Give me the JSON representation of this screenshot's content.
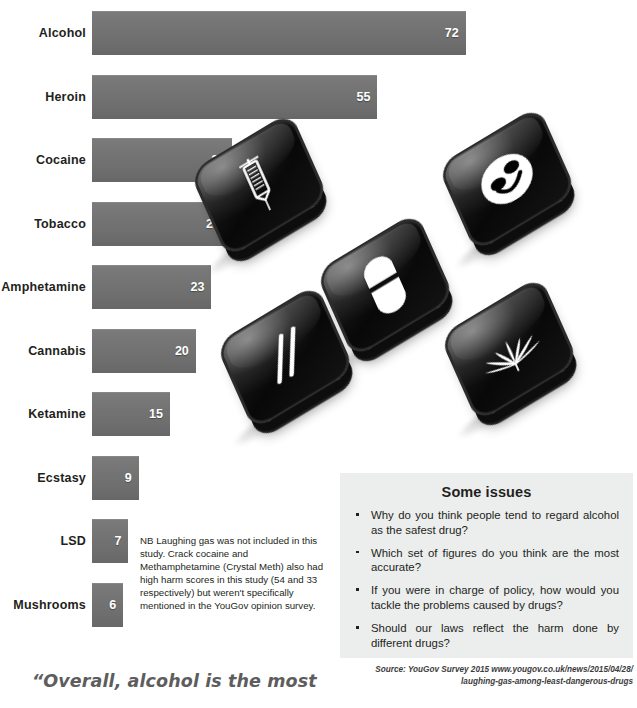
{
  "chart_data": {
    "type": "bar",
    "title": "",
    "xlabel": "",
    "ylabel": "",
    "orientation": "horizontal",
    "grid": false,
    "legend": "none",
    "xlim": [
      0,
      72
    ],
    "categories": [
      "Alcohol",
      "Heroin",
      "Cocaine",
      "Tobacco",
      "Amphetamine",
      "Cannabis",
      "Ketamine",
      "Ecstasy",
      "LSD",
      "Mushrooms"
    ],
    "values": [
      72,
      55,
      27,
      26,
      23,
      20,
      15,
      9,
      7,
      6
    ],
    "bars": [
      {
        "label": "Alcohol",
        "value": 72
      },
      {
        "label": "Heroin",
        "value": 55
      },
      {
        "label": "Cocaine",
        "value": 27
      },
      {
        "label": "Tobacco",
        "value": 26
      },
      {
        "label": "Amphetamine",
        "value": 23
      },
      {
        "label": "Cannabis",
        "value": 20
      },
      {
        "label": "Ketamine",
        "value": 15
      },
      {
        "label": "Ecstasy",
        "value": 9
      },
      {
        "label": "LSD",
        "value": 7
      },
      {
        "label": "Mushrooms",
        "value": 6
      }
    ],
    "bar_color": "#737373",
    "value_label_color": "#ffffff"
  },
  "note": "NB Laughing gas was not included in this study. Crack cocaine and Methamphetamine (Crystal Meth) also had high harm scores in this study (54 and 33 respectively) but weren't specifically mentioned in the YouGov opinion survey.",
  "quote": "“Overall, alcohol is the most",
  "tiles": [
    {
      "name": "syringe-tile",
      "icon": "syringe-icon"
    },
    {
      "name": "smiley-tile",
      "icon": "smiley-face-icon"
    },
    {
      "name": "pill-tile",
      "icon": "capsule-pill-icon"
    },
    {
      "name": "lines-tile",
      "icon": "cocaine-lines-icon"
    },
    {
      "name": "cannabis-tile",
      "icon": "cannabis-leaf-icon"
    }
  ],
  "issues": {
    "heading": "Some issues",
    "items": [
      "Why do you think people tend to regard alcohol as the safest drug?",
      "Which set of figures do you think are the most accurate?",
      "If you were in charge of policy, how would you tackle the problems caused by drugs?",
      "Should our laws reflect the harm done by different drugs?"
    ]
  },
  "source": {
    "line1": "Source: YouGov Survey 2015   www.yougov.co.uk/news/2015/04/28/",
    "line2": "laughing-gas-among-least-dangerous-drugs"
  },
  "colors": {
    "panel_bg": "#eceded",
    "bar": "#737373",
    "text": "#231f20",
    "quote": "#5d5d5d"
  }
}
